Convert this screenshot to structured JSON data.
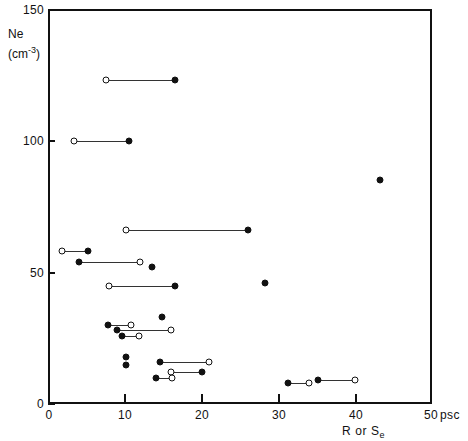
{
  "figure": {
    "background": "#ffffff",
    "ink": "#111111"
  },
  "axes": {
    "x_ticks": [
      "0",
      "10",
      "20",
      "30",
      "40",
      "50"
    ],
    "y_ticks": [
      "0",
      "50",
      "100",
      "150"
    ],
    "x_unit": "psc",
    "x_label_main": "R or S",
    "x_label_sub": "e",
    "y_label_main": "Ne",
    "y_label_unit_open": "(cm",
    "y_label_unit_exp": "-3",
    "y_label_unit_close": ")"
  },
  "chart_data": {
    "type": "scatter",
    "title": "",
    "xlabel": "R or S_e",
    "ylabel": "Ne (cm^-3)",
    "xunit": "psc",
    "yunit": "cm^-3",
    "xlim": [
      0,
      50
    ],
    "ylim": [
      0,
      150
    ],
    "xticks": [
      0,
      10,
      20,
      30,
      40,
      50
    ],
    "yticks": [
      0,
      50,
      100,
      150
    ],
    "grid": false,
    "legend": null,
    "marker_types": {
      "open": "open circle",
      "filled": "filled circle"
    },
    "note": "Paired measurements joined by a horizontal connector line share the same Ne value; each pair reports two radius estimates (R and S_e).",
    "pairs": [
      {
        "ne": 123,
        "open_x": 7.6,
        "filled_x": 16.6
      },
      {
        "ne": 100,
        "open_x": 3.4,
        "filled_x": 10.6
      },
      {
        "ne": 66,
        "open_x": 10.2,
        "filled_x": 26.0
      },
      {
        "ne": 58,
        "open_x": 1.8,
        "filled_x": 5.2
      },
      {
        "ne": 54,
        "open_x": 12.0,
        "filled_x": 4.0
      },
      {
        "ne": 45,
        "open_x": 8.0,
        "filled_x": 16.6
      },
      {
        "ne": 30,
        "open_x": 10.8,
        "filled_x": 7.8
      },
      {
        "ne": 28,
        "open_x": 16.0,
        "filled_x": 9.0
      },
      {
        "ne": 26,
        "open_x": 11.8,
        "filled_x": 9.6
      },
      {
        "ne": 16,
        "open_x": 21.0,
        "filled_x": 14.6
      },
      {
        "ne": 12,
        "open_x": 16.0,
        "filled_x": 20.0
      },
      {
        "ne": 10,
        "open_x": 16.2,
        "filled_x": 14.0
      },
      {
        "ne": 8,
        "open_x": 34.0,
        "filled_x": 31.2
      },
      {
        "ne": 9,
        "open_x": 40.0,
        "filled_x": 35.2
      }
    ],
    "singles": [
      {
        "ne": 85,
        "x": 43.2,
        "marker": "filled"
      },
      {
        "ne": 52,
        "x": 13.6,
        "marker": "filled"
      },
      {
        "ne": 46,
        "x": 28.2,
        "marker": "filled"
      },
      {
        "ne": 33,
        "x": 14.8,
        "marker": "filled"
      },
      {
        "ne": 18,
        "x": 10.2,
        "marker": "filled"
      },
      {
        "ne": 15,
        "x": 10.2,
        "marker": "filled"
      }
    ]
  }
}
